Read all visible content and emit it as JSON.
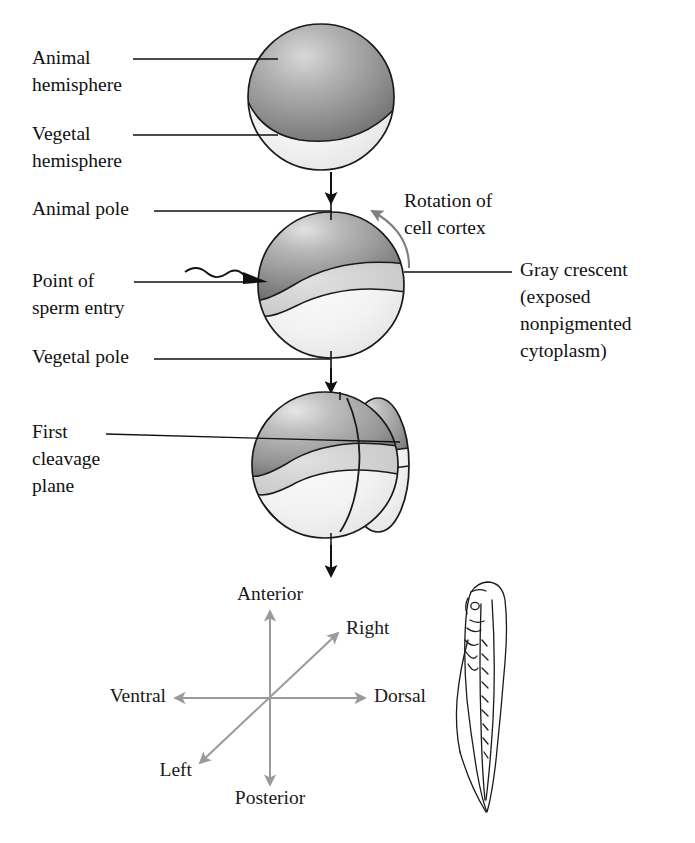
{
  "figure": {
    "background_color": "#ffffff",
    "ink_color": "#111111",
    "compass_arrow_color": "#9a9a9a",
    "rotation_arrow_color": "#7f7f7f",
    "pigment_color": "#8e8e8e",
    "vegetal_color": "#f0f0f0",
    "crescent_color": "#d2d2d2"
  },
  "stages": [
    {
      "id": "stage-1-unfertilized-egg",
      "labels": [
        {
          "id": "animal-hemisphere",
          "line1": "Animal",
          "line2": "hemisphere"
        },
        {
          "id": "vegetal-hemisphere",
          "line1": "Vegetal",
          "line2": "hemisphere"
        }
      ]
    },
    {
      "id": "stage-2-fertilized-egg",
      "labels": [
        {
          "id": "animal-pole",
          "line1": "Animal pole",
          "line2": ""
        },
        {
          "id": "point-of-sperm-entry",
          "line1": "Point of",
          "line2": "sperm entry"
        },
        {
          "id": "vegetal-pole",
          "line1": "Vegetal pole",
          "line2": ""
        },
        {
          "id": "rotation-of-cell-cortex",
          "line1": "Rotation of",
          "line2": "cell cortex"
        },
        {
          "id": "gray-crescent",
          "line1": "Gray crescent",
          "line2": "(exposed",
          "line3": "nonpigmented",
          "line4": "cytoplasm)"
        }
      ]
    },
    {
      "id": "stage-3-two-cell-embryo",
      "labels": [
        {
          "id": "first-cleavage-plane",
          "line1": "First",
          "line2": "cleavage",
          "line3": "plane"
        }
      ]
    }
  ],
  "compass": {
    "id": "body-axes-compass",
    "axes": [
      {
        "id": "anterior",
        "label": "Anterior"
      },
      {
        "id": "posterior",
        "label": "Posterior"
      },
      {
        "id": "ventral",
        "label": "Ventral"
      },
      {
        "id": "dorsal",
        "label": "Dorsal"
      },
      {
        "id": "right",
        "label": "Right"
      },
      {
        "id": "left",
        "label": "Left"
      }
    ]
  },
  "tadpole": {
    "id": "tadpole-larva-illustration",
    "orientation": "dorsal view, head at top"
  }
}
